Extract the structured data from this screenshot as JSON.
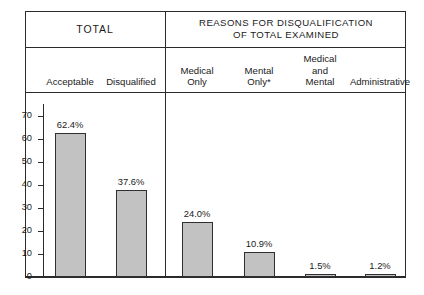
{
  "header": {
    "total_label": "TOTAL",
    "reasons_line1": "REASONS FOR DISQUALIFICATION",
    "reasons_line2": "OF TOTAL EXAMINED"
  },
  "columns": [
    {
      "id": "acceptable",
      "lines": [
        "Acceptable"
      ]
    },
    {
      "id": "disqualified",
      "lines": [
        "Disqualified"
      ]
    },
    {
      "id": "medical-only",
      "lines": [
        "Medical",
        "Only"
      ]
    },
    {
      "id": "mental-only",
      "lines": [
        "Mental",
        "Only*"
      ]
    },
    {
      "id": "medical-mental",
      "lines": [
        "Medical",
        "and",
        "Mental"
      ]
    },
    {
      "id": "administrative",
      "lines": [
        "Administrative"
      ]
    }
  ],
  "chart_data": {
    "type": "bar",
    "title": "",
    "xlabel": "",
    "ylabel": "",
    "ylim": [
      0,
      75
    ],
    "yticks": [
      0,
      10,
      20,
      30,
      40,
      50,
      60,
      70
    ],
    "grid": false,
    "legend": "none",
    "categories": [
      "Acceptable",
      "Disqualified",
      "Medical Only",
      "Mental Only*",
      "Medical and Mental",
      "Administrative"
    ],
    "values": [
      62.4,
      37.6,
      24.0,
      10.9,
      1.5,
      1.2
    ],
    "labels": [
      "62.4%",
      "37.6%",
      "24.0%",
      "10.9%",
      "1.5%",
      "1.2%"
    ],
    "bar_color": "#c2c2c2",
    "bar_edge_color": "#2f2f2f"
  }
}
